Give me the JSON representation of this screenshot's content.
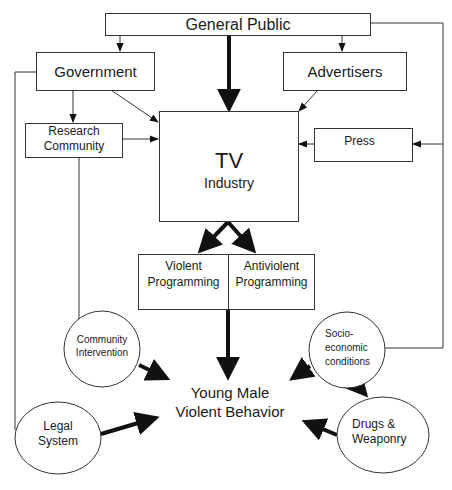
{
  "nodes": {
    "general_public": {
      "label": "General Public"
    },
    "government": {
      "label": "Government"
    },
    "advertisers": {
      "label": "Advertisers"
    },
    "research_community": {
      "line1": "Research",
      "line2": "Community"
    },
    "press": {
      "label": "Press"
    },
    "tv_industry": {
      "line1": "TV",
      "line2": "Industry"
    },
    "violent_programming": {
      "line1": "Violent",
      "line2": "Programming"
    },
    "antiviolent_programming": {
      "line1": "Antiviolent",
      "line2": "Programming"
    },
    "community_intervention": {
      "line1": "Community",
      "line2": "Intervention"
    },
    "socioeconomic_conditions": {
      "line1": "Socio-",
      "line2": "economic",
      "line3": "conditions"
    },
    "young_male_violent_behavior": {
      "line1": "Young Male",
      "line2": "Violent Behavior"
    },
    "legal_system": {
      "line1": "Legal",
      "line2": "System"
    },
    "drugs_weaponry": {
      "line1": "Drugs &",
      "line2": "Weaponry"
    }
  },
  "edges": [
    {
      "from": "General Public",
      "to": "Government",
      "weight": "thin"
    },
    {
      "from": "General Public",
      "to": "TV Industry",
      "weight": "thick"
    },
    {
      "from": "General Public",
      "to": "Advertisers",
      "weight": "thin"
    },
    {
      "from": "General Public",
      "to": "Press",
      "weight": "thin"
    },
    {
      "from": "General Public",
      "to": "Socio-economic conditions",
      "weight": "line"
    },
    {
      "from": "Government",
      "to": "Research Community",
      "weight": "thin"
    },
    {
      "from": "Government",
      "to": "TV Industry",
      "weight": "thin"
    },
    {
      "from": "Government",
      "to": "Legal System",
      "weight": "line"
    },
    {
      "from": "Advertisers",
      "to": "TV Industry",
      "weight": "thin"
    },
    {
      "from": "Research Community",
      "to": "TV Industry",
      "weight": "thin"
    },
    {
      "from": "Research Community",
      "to": "Community Intervention",
      "weight": "line"
    },
    {
      "from": "Press",
      "to": "TV Industry",
      "weight": "thin"
    },
    {
      "from": "TV Industry",
      "to": "Violent Programming",
      "weight": "thick"
    },
    {
      "from": "TV Industry",
      "to": "Antiviolent Programming",
      "weight": "thick"
    },
    {
      "from": "Programming",
      "to": "Young Male Violent Behavior",
      "weight": "thick"
    },
    {
      "from": "Community Intervention",
      "to": "Young Male Violent Behavior",
      "weight": "thick"
    },
    {
      "from": "Socio-economic conditions",
      "to": "Young Male Violent Behavior",
      "weight": "thick"
    },
    {
      "from": "Socio-economic conditions",
      "to": "Drugs & Weaponry",
      "weight": "thick"
    },
    {
      "from": "Legal System",
      "to": "Young Male Violent Behavior",
      "weight": "thick"
    },
    {
      "from": "Drugs & Weaponry",
      "to": "Young Male Violent Behavior",
      "weight": "thick"
    }
  ],
  "colors": {
    "stroke": "#333333",
    "text": "#1a1a1a",
    "background": "#ffffff"
  }
}
